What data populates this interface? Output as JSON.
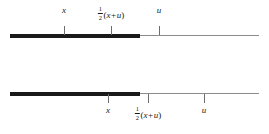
{
  "figure": {
    "width": 269,
    "height": 134,
    "background": "#ffffff",
    "thick_color": "#1a1a1a",
    "thin_color": "#8c8c8c",
    "tick_color": "#6e6e6e",
    "text_color": "#1a1a1a"
  },
  "lines": [
    {
      "id": "top",
      "name": "upper-number-line",
      "axis_y": 35,
      "thick_start_x": 10,
      "thick_end_x": 140,
      "thin_end_x": 259,
      "tick_direction": "up",
      "tick_length": 9,
      "label_side": "above",
      "label_y": 6,
      "ticks": [
        {
          "id": "x",
          "x": 64,
          "label_text": "x",
          "label_type": "variable"
        },
        {
          "id": "midpoint",
          "x": 111,
          "label_text": "½(x + u)",
          "label_type": "fraction-expression"
        },
        {
          "id": "u",
          "x": 159,
          "label_text": "u",
          "label_type": "variable"
        }
      ]
    },
    {
      "id": "bottom",
      "name": "lower-number-line",
      "axis_y": 93,
      "thick_start_x": 10,
      "thick_end_x": 140,
      "thin_end_x": 259,
      "tick_direction": "down",
      "tick_length": 9,
      "label_side": "below",
      "label_y": 106,
      "ticks": [
        {
          "id": "x",
          "x": 108,
          "label_text": "x",
          "label_type": "variable"
        },
        {
          "id": "midpoint",
          "x": 148,
          "label_text": "½(x + u)",
          "label_type": "fraction-expression"
        },
        {
          "id": "u",
          "x": 204,
          "label_text": "u",
          "label_type": "variable"
        }
      ]
    }
  ],
  "math": {
    "fraction_numerator": "1",
    "fraction_denominator": "2",
    "open_paren": "(",
    "close_paren": ")",
    "plus": "+",
    "var_x": "x",
    "var_u": "u"
  }
}
